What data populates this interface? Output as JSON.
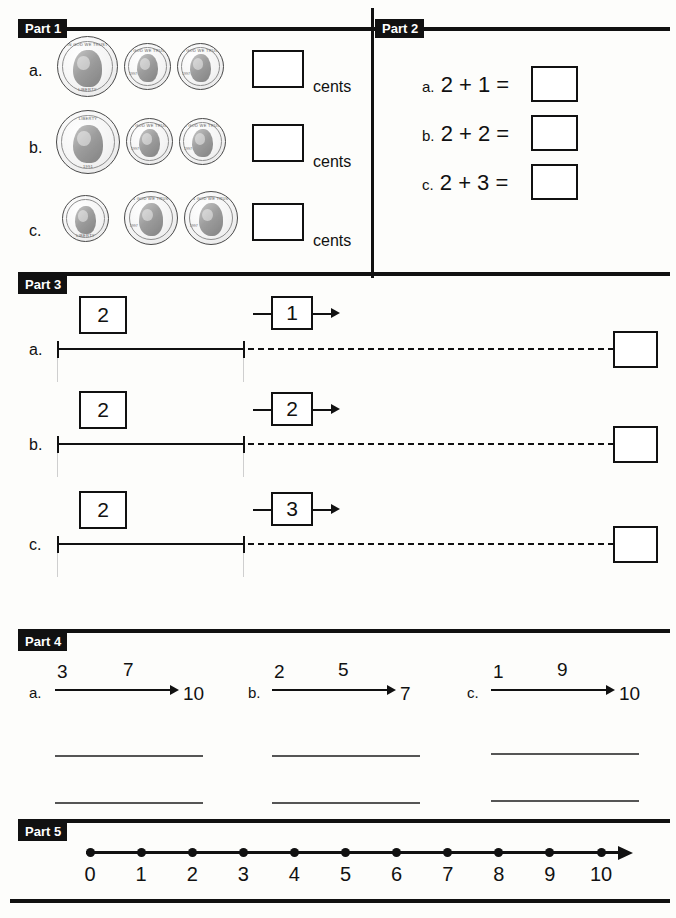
{
  "worksheet": {
    "parts": [
      {
        "id": "part1",
        "label": "Part 1"
      },
      {
        "id": "part2",
        "label": "Part 2"
      },
      {
        "id": "part3",
        "label": "Part 3"
      },
      {
        "id": "part4",
        "label": "Part 4"
      },
      {
        "id": "part5",
        "label": "Part 5"
      }
    ]
  },
  "part1": {
    "label": "Part 1",
    "unit_label": "cents",
    "items": [
      {
        "letter": "a.",
        "coins": [
          {
            "name": "nickel-coin",
            "legend_top": "IN GOD WE TRUST",
            "legend_bottom": "LIBERTY",
            "year": "1997"
          },
          {
            "name": "penny-coin",
            "legend_top": "IN GOD WE TRUST",
            "legend_bottom": "LIBERTY",
            "year": "1997"
          },
          {
            "name": "penny-coin",
            "legend_top": "IN GOD WE TRUST",
            "legend_bottom": "LIBERTY",
            "year": "1997"
          }
        ],
        "answer": "",
        "unit": "cents"
      },
      {
        "letter": "b.",
        "coins": [
          {
            "name": "quarter-coin",
            "legend_top": "LIBERTY",
            "legend_bottom": "1991",
            "year": "1991"
          },
          {
            "name": "penny-coin",
            "legend_top": "IN GOD WE TRUST",
            "legend_bottom": "LIBERTY",
            "year": "1997"
          },
          {
            "name": "penny-coin",
            "legend_top": "IN GOD WE TRUST",
            "legend_bottom": "LIBERTY",
            "year": "1997"
          }
        ],
        "answer": "",
        "unit": "cents"
      },
      {
        "letter": "c.",
        "coins": [
          {
            "name": "dime-coin",
            "legend_top": "IN GOD WE TRUST",
            "legend_bottom": "LIBERTY",
            "year": "1995"
          },
          {
            "name": "penny-coin",
            "legend_top": "IN GOD WE TRUST",
            "legend_bottom": "LIBERTY",
            "year": "1997"
          },
          {
            "name": "penny-coin",
            "legend_top": "IN GOD WE TRUST",
            "legend_bottom": "LIBERTY",
            "year": "1997"
          }
        ],
        "answer": "",
        "unit": "cents"
      }
    ]
  },
  "part2": {
    "label": "Part 2",
    "items": [
      {
        "letter": "a.",
        "expression": "2 + 1 =",
        "answer": ""
      },
      {
        "letter": "b.",
        "expression": "2 + 2 =",
        "answer": ""
      },
      {
        "letter": "c.",
        "expression": "2 + 3 =",
        "answer": ""
      }
    ]
  },
  "part3": {
    "label": "Part 3",
    "items": [
      {
        "letter": "a.",
        "start_value": "2",
        "jump_value": "1",
        "answer": ""
      },
      {
        "letter": "b.",
        "start_value": "2",
        "jump_value": "2",
        "answer": ""
      },
      {
        "letter": "c.",
        "start_value": "2",
        "jump_value": "3",
        "answer": ""
      }
    ]
  },
  "part4": {
    "label": "Part 4",
    "items": [
      {
        "letter": "a.",
        "start": "3",
        "change": "7",
        "end": "10",
        "answer_line_1": "",
        "answer_line_2": ""
      },
      {
        "letter": "b.",
        "start": "2",
        "change": "5",
        "end": "7",
        "answer_line_1": "",
        "answer_line_2": ""
      },
      {
        "letter": "c.",
        "start": "1",
        "change": "9",
        "end": "10",
        "answer_line_1": "",
        "answer_line_2": ""
      }
    ]
  },
  "part5": {
    "label": "Part 5",
    "number_line": {
      "labels": [
        "0",
        "1",
        "2",
        "3",
        "4",
        "5",
        "6",
        "7",
        "8",
        "9",
        "10"
      ]
    }
  },
  "colors": {
    "ink": "#111111",
    "paper": "#fdfdfb",
    "tab_bg": "#111111",
    "tab_text": "#ffffff"
  }
}
